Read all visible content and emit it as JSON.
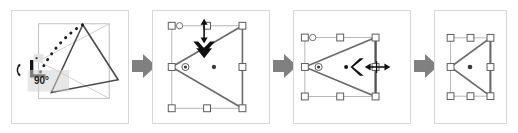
{
  "figure": {
    "panel_count": 4,
    "background_color": "#ffffff",
    "panel_border_color": "#d8d8d8",
    "shape_stroke_color": "#555555",
    "ghost_stroke_color": "#bbbbbb",
    "handle_fill_color": "#ffffff",
    "handle_stroke_color": "#666666",
    "cursor_color": "#111111",
    "arrow_color": "#808080"
  },
  "panels": [
    {
      "id": "panel-rotate",
      "name": "rotate-step",
      "caption": "",
      "angle_label": "90°",
      "icons": [
        "rotate-cursor-icon",
        "right-angle-marker-icon",
        "dotted-rotation-path-icon"
      ],
      "description": "Triangle rotated with dotted arc path and 90 degree readout"
    },
    {
      "id": "panel-resize-vertical",
      "name": "resize-vertical-step",
      "caption": "",
      "angle_label": "",
      "icons": [
        "vertical-resize-cursor-icon",
        "down-arrow-cursor-icon",
        "anchor-point-icon",
        "center-point-icon"
      ],
      "description": "Selected triangle with top-center handle dragged downward"
    },
    {
      "id": "panel-resize-horizontal",
      "name": "resize-horizontal-step",
      "caption": "",
      "angle_label": "",
      "icons": [
        "left-arrow-cursor-icon",
        "horizontal-resize-cursor-icon",
        "anchor-point-icon"
      ],
      "description": "Selected triangle with right-middle handle dragged leftward"
    },
    {
      "id": "panel-result",
      "name": "result-step",
      "caption": "",
      "angle_label": "",
      "icons": [
        "center-point-icon"
      ],
      "description": "Final resized triangle still selected"
    }
  ],
  "arrows": [
    {
      "name": "flow-arrow-1",
      "direction": "right"
    },
    {
      "name": "flow-arrow-2",
      "direction": "right"
    },
    {
      "name": "flow-arrow-3",
      "direction": "right"
    }
  ]
}
